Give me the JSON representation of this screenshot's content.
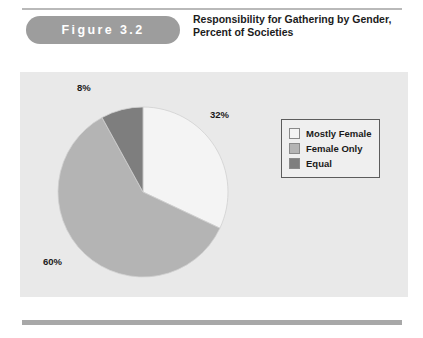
{
  "figure": {
    "badge_label": "Figure 3.2",
    "title_line_1": "Responsibility for Gathering by Gender,",
    "title_line_2": "Percent of Societies"
  },
  "legend": {
    "items": [
      {
        "label": "Mostly Female",
        "color": "#f4f4f4"
      },
      {
        "label": "Female Only",
        "color": "#b4b4b4"
      },
      {
        "label": "Equal",
        "color": "#7e7e7e"
      }
    ]
  },
  "colors": {
    "badge_background": "#9d9d9d",
    "badge_text": "#ffffff",
    "plot_background": "#e9e9e9",
    "page_background": "#ffffff",
    "rule": "#a8a8a8",
    "legend_border": "#5c5c5c",
    "text": "#1a1a1a"
  },
  "chart_data": {
    "type": "pie",
    "title": "Responsibility for Gathering by Gender, Percent of Societies",
    "unit": "percent",
    "start_angle_deg": 0,
    "direction": "clockwise",
    "labels": [
      "Mostly Female",
      "Female Only",
      "Equal"
    ],
    "values": [
      32,
      60,
      8
    ],
    "value_labels": [
      "32%",
      "60%",
      "8%"
    ],
    "colors": [
      "#f4f4f4",
      "#b4b4b4",
      "#7e7e7e"
    ],
    "legend_position": "right",
    "grid": false,
    "slices": [
      {
        "label": "Mostly Female",
        "value": 32,
        "value_label": "32%",
        "color": "#f4f4f4"
      },
      {
        "label": "Female Only",
        "value": 60,
        "value_label": "60%",
        "color": "#b4b4b4"
      },
      {
        "label": "Equal",
        "value": 8,
        "value_label": "8%",
        "color": "#7e7e7e"
      }
    ]
  }
}
